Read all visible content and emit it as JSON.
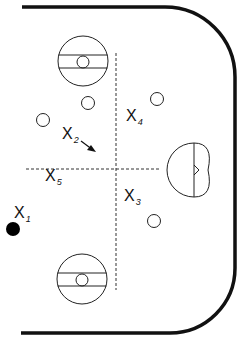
{
  "diagram": {
    "type": "hockey-rink-half-zone-drill",
    "colors": {
      "board": "#111111",
      "line": "#222222",
      "puck": "#000000",
      "background": "#ffffff"
    },
    "players": [
      {
        "id": "x1",
        "letter": "X",
        "number": "1",
        "x": 14,
        "y": 205
      },
      {
        "id": "x2",
        "letter": "X",
        "number": "2",
        "x": 60,
        "y": 125
      },
      {
        "id": "x3",
        "letter": "X",
        "number": "3",
        "x": 123,
        "y": 190
      },
      {
        "id": "x4",
        "letter": "X",
        "number": "4",
        "x": 125,
        "y": 109
      },
      {
        "id": "x5",
        "letter": "X",
        "number": "5",
        "x": 44,
        "y": 170
      }
    ],
    "pylons": [
      {
        "x": 88,
        "y": 103
      },
      {
        "x": 43,
        "y": 120
      },
      {
        "x": 157,
        "y": 99
      },
      {
        "x": 154,
        "y": 221
      }
    ],
    "faceoff_circles": [
      {
        "x": 83,
        "y": 61
      },
      {
        "x": 82,
        "y": 279
      }
    ],
    "puck": {
      "x": 13,
      "y": 229
    }
  }
}
